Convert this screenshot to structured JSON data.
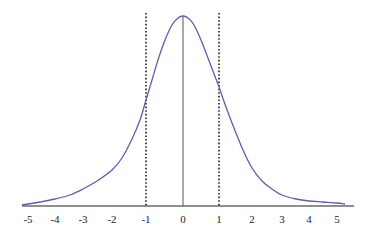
{
  "chart_data": {
    "type": "line",
    "title": "",
    "xlabel": "",
    "ylabel": "",
    "xlim": [
      -5.3,
      5.6
    ],
    "grid": false,
    "legend": null,
    "x_ticks": [
      -5,
      -4,
      -3,
      -2,
      -1,
      0,
      1,
      2,
      3,
      4,
      5
    ],
    "x_tick_labels": [
      "-5",
      "-4",
      "-3",
      "-2",
      "-1",
      "0",
      "1",
      "2",
      "3",
      "4",
      "5"
    ],
    "x_tick_pixel_positions": [
      28,
      55,
      83,
      112,
      146,
      183,
      219,
      252,
      282,
      309,
      337
    ],
    "series": [
      {
        "name": "density curve",
        "color": "#5a5fb0",
        "points_px": [
          [
            22,
            205
          ],
          [
            28,
            204
          ],
          [
            40,
            202
          ],
          [
            55,
            199
          ],
          [
            70,
            195
          ],
          [
            83,
            189
          ],
          [
            97,
            181
          ],
          [
            112,
            170
          ],
          [
            122,
            158
          ],
          [
            132,
            139
          ],
          [
            140,
            120
          ],
          [
            146,
            100
          ],
          [
            152,
            80
          ],
          [
            158,
            60
          ],
          [
            165,
            40
          ],
          [
            172,
            25
          ],
          [
            178,
            18
          ],
          [
            183,
            16
          ],
          [
            188,
            18
          ],
          [
            194,
            25
          ],
          [
            201,
            40
          ],
          [
            208,
            58
          ],
          [
            214,
            74
          ],
          [
            219,
            87
          ],
          [
            226,
            107
          ],
          [
            234,
            128
          ],
          [
            243,
            150
          ],
          [
            252,
            168
          ],
          [
            262,
            181
          ],
          [
            272,
            189
          ],
          [
            282,
            195
          ],
          [
            296,
            199
          ],
          [
            309,
            201
          ],
          [
            323,
            202
          ],
          [
            337,
            203
          ],
          [
            345,
            204
          ]
        ]
      }
    ],
    "annotations": [
      {
        "type": "vline",
        "x": -1,
        "style": "dotted",
        "color": "#222222"
      },
      {
        "type": "vline",
        "x": 1,
        "style": "dotted",
        "color": "#222222"
      },
      {
        "type": "vline",
        "x": 0,
        "style": "solid",
        "color": "#555555",
        "note": "from peak to axis"
      }
    ]
  },
  "colors": {
    "curve": "#5a5fb0",
    "axis": "#555555",
    "dotted": "#222222",
    "background": "#ffffff"
  }
}
